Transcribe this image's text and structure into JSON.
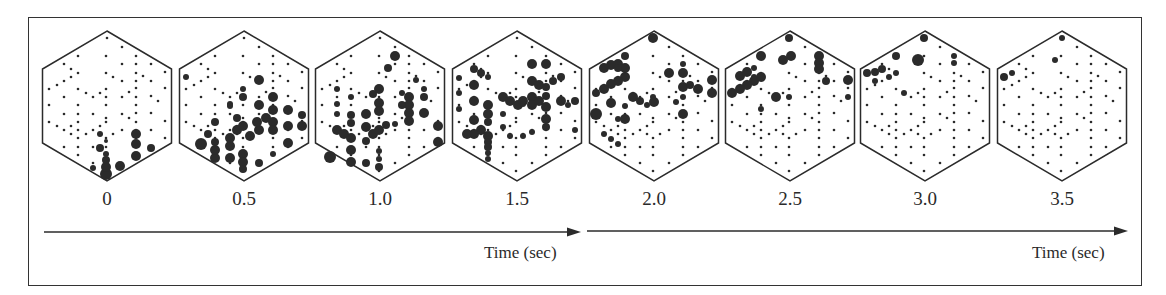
{
  "figure": {
    "frame_labels": [
      "0",
      "0.5",
      "1.0",
      "1.5",
      "2.0",
      "2.5",
      "3.0",
      "3.5"
    ],
    "axis_labels": [
      "Time (sec)",
      "Time (sec)"
    ],
    "colors": {
      "ink": "#2b2b2b",
      "background": "#ffffff"
    },
    "panel_centers_x": [
      107,
      244,
      380,
      517,
      654,
      790,
      925,
      1062
    ],
    "panel_center_y": 106
  },
  "electrode_grid": [
    [
      0,
      -68
    ],
    [
      15,
      -59
    ],
    [
      -29,
      -50
    ],
    [
      -1,
      -50
    ],
    [
      29,
      -50
    ],
    [
      -43,
      -42
    ],
    [
      15,
      -42
    ],
    [
      29,
      -42
    ],
    [
      44,
      -42
    ],
    [
      -36,
      -37
    ],
    [
      -29,
      -33
    ],
    [
      -1,
      -33
    ],
    [
      29,
      -33
    ],
    [
      58,
      -34
    ],
    [
      -36,
      -29
    ],
    [
      -43,
      -25
    ],
    [
      6,
      -29
    ],
    [
      15,
      -25
    ],
    [
      29,
      -25
    ],
    [
      36,
      -30
    ],
    [
      44,
      -25
    ],
    [
      -50,
      -21
    ],
    [
      -58,
      -17
    ],
    [
      -29,
      -17
    ],
    [
      -1,
      -17
    ],
    [
      29,
      -18
    ],
    [
      58,
      -18
    ],
    [
      -21,
      -13
    ],
    [
      -7,
      -13
    ],
    [
      22,
      -14
    ],
    [
      -43,
      -9
    ],
    [
      -14,
      -9
    ],
    [
      -1,
      -9
    ],
    [
      15,
      -9
    ],
    [
      29,
      -9
    ],
    [
      44,
      -10
    ],
    [
      51,
      -5
    ],
    [
      -58,
      -1
    ],
    [
      -29,
      -1
    ],
    [
      -1,
      -1
    ],
    [
      29,
      -1
    ],
    [
      -43,
      8
    ],
    [
      -29,
      8
    ],
    [
      -14,
      8
    ],
    [
      15,
      8
    ],
    [
      29,
      7
    ],
    [
      44,
      7
    ],
    [
      -1,
      12
    ],
    [
      22,
      12
    ],
    [
      -58,
      16
    ],
    [
      -29,
      16
    ],
    [
      -1,
      16
    ],
    [
      29,
      16
    ],
    [
      58,
      15
    ],
    [
      -50,
      20
    ],
    [
      -36,
      20
    ],
    [
      -7,
      20
    ],
    [
      -43,
      24
    ],
    [
      -29,
      24
    ],
    [
      -14,
      24
    ],
    [
      15,
      24
    ],
    [
      29,
      24
    ],
    [
      44,
      24
    ],
    [
      -36,
      28
    ],
    [
      -21,
      28
    ],
    [
      -7,
      28
    ],
    [
      6,
      28
    ],
    [
      -29,
      32
    ],
    [
      -1,
      32
    ],
    [
      29,
      32
    ],
    [
      58,
      32
    ],
    [
      -43,
      41
    ],
    [
      -29,
      41
    ],
    [
      -14,
      41
    ],
    [
      -1,
      41
    ],
    [
      29,
      41
    ],
    [
      44,
      41
    ],
    [
      -29,
      49
    ],
    [
      -1,
      49
    ],
    [
      29,
      49
    ],
    [
      -14,
      57
    ],
    [
      15,
      57
    ],
    [
      -1,
      65
    ]
  ],
  "active_sites": [
    [
      [
        -1,
        68,
        6
      ],
      [
        -1,
        61,
        5
      ],
      [
        -1,
        54,
        4
      ],
      [
        -1,
        48,
        3
      ],
      [
        -14,
        62,
        3
      ],
      [
        -7,
        42,
        4
      ],
      [
        -7,
        28,
        3
      ],
      [
        13,
        60,
        5
      ],
      [
        29,
        50,
        5
      ],
      [
        29,
        38,
        5
      ],
      [
        44,
        42,
        4
      ],
      [
        29,
        28,
        5
      ],
      [
        -1,
        35,
        2
      ]
    ],
    [
      [
        -58,
        -29,
        3
      ],
      [
        -43,
        38,
        6
      ],
      [
        -29,
        52,
        5
      ],
      [
        -29,
        44,
        5
      ],
      [
        -29,
        36,
        4
      ],
      [
        -36,
        28,
        4
      ],
      [
        -14,
        52,
        5
      ],
      [
        -14,
        40,
        5
      ],
      [
        -1,
        48,
        5
      ],
      [
        -1,
        56,
        5
      ],
      [
        -1,
        63,
        4
      ],
      [
        15,
        57,
        4
      ],
      [
        -14,
        32,
        5
      ],
      [
        -7,
        24,
        5
      ],
      [
        -1,
        20,
        5
      ],
      [
        6,
        30,
        5
      ],
      [
        15,
        24,
        5
      ],
      [
        -7,
        12,
        4
      ],
      [
        13,
        16,
        5
      ],
      [
        22,
        12,
        5
      ],
      [
        29,
        -9,
        5
      ],
      [
        15,
        -1,
        5
      ],
      [
        29,
        4,
        5
      ],
      [
        29,
        16,
        5
      ],
      [
        29,
        24,
        5
      ],
      [
        44,
        4,
        5
      ],
      [
        44,
        20,
        5
      ],
      [
        44,
        37,
        5
      ],
      [
        58,
        20,
        5
      ],
      [
        58,
        9,
        4
      ],
      [
        -14,
        -2,
        3
      ],
      [
        -1,
        -9,
        4
      ],
      [
        -1,
        -17,
        3
      ],
      [
        -14,
        0,
        3
      ],
      [
        29,
        48,
        3
      ],
      [
        15,
        -26,
        5
      ],
      [
        -29,
        16,
        4
      ]
    ],
    [
      [
        -50,
        51,
        6
      ],
      [
        -43,
        24,
        5
      ],
      [
        -36,
        28,
        5
      ],
      [
        -29,
        32,
        5
      ],
      [
        -29,
        44,
        5
      ],
      [
        -29,
        56,
        5
      ],
      [
        -29,
        17,
        4
      ],
      [
        -29,
        9,
        4
      ],
      [
        -14,
        35,
        4
      ],
      [
        -14,
        21,
        5
      ],
      [
        -7,
        28,
        5
      ],
      [
        -1,
        24,
        5
      ],
      [
        6,
        19,
        4
      ],
      [
        -14,
        8,
        5
      ],
      [
        -1,
        -17,
        5
      ],
      [
        -7,
        -12,
        4
      ],
      [
        -1,
        -3,
        5
      ],
      [
        -1,
        5,
        5
      ],
      [
        15,
        -50,
        5
      ],
      [
        8,
        -38,
        4
      ],
      [
        29,
        -9,
        5
      ],
      [
        29,
        -1,
        5
      ],
      [
        29,
        7,
        5
      ],
      [
        29,
        15,
        5
      ],
      [
        22,
        -1,
        4
      ],
      [
        44,
        -9,
        4
      ],
      [
        44,
        7,
        5
      ],
      [
        58,
        20,
        5
      ],
      [
        58,
        36,
        5
      ],
      [
        -14,
        57,
        4
      ],
      [
        -1,
        61,
        4
      ],
      [
        -1,
        53,
        3
      ],
      [
        -1,
        45,
        3
      ],
      [
        -29,
        -9,
        3
      ],
      [
        -43,
        -2,
        3
      ],
      [
        -43,
        8,
        3
      ],
      [
        -43,
        -17,
        3
      ],
      [
        22,
        -13,
        3
      ],
      [
        36,
        -26,
        3
      ],
      [
        44,
        -17,
        3
      ],
      [
        15,
        18,
        3
      ]
    ],
    [
      [
        -43,
        -37,
        4
      ],
      [
        -36,
        -33,
        4
      ],
      [
        -29,
        -29,
        3
      ],
      [
        -43,
        -21,
        5
      ],
      [
        -58,
        -13,
        3
      ],
      [
        -43,
        -5,
        5
      ],
      [
        -58,
        3,
        3
      ],
      [
        -43,
        14,
        5
      ],
      [
        -29,
        -1,
        5
      ],
      [
        -29,
        8,
        5
      ],
      [
        -29,
        16,
        4
      ],
      [
        -36,
        24,
        5
      ],
      [
        -43,
        28,
        5
      ],
      [
        -50,
        28,
        5
      ],
      [
        -29,
        30,
        5
      ],
      [
        -29,
        36,
        4
      ],
      [
        -14,
        -9,
        5
      ],
      [
        -7,
        -5,
        5
      ],
      [
        1,
        -1,
        5
      ],
      [
        6,
        -5,
        5
      ],
      [
        15,
        -9,
        5
      ],
      [
        15,
        -1,
        5
      ],
      [
        6,
        -2,
        3
      ],
      [
        15,
        -25,
        5
      ],
      [
        22,
        -21,
        5
      ],
      [
        29,
        -19,
        4
      ],
      [
        36,
        -25,
        4
      ],
      [
        44,
        -29,
        4
      ],
      [
        29,
        -10,
        4
      ],
      [
        22,
        -5,
        5
      ],
      [
        29,
        1,
        5
      ],
      [
        29,
        13,
        5
      ],
      [
        29,
        21,
        4
      ],
      [
        44,
        -5,
        5
      ],
      [
        51,
        -1,
        3
      ],
      [
        58,
        -5,
        4
      ],
      [
        15,
        -42,
        5
      ],
      [
        29,
        -42,
        5
      ],
      [
        -29,
        47,
        3
      ],
      [
        -29,
        41,
        4
      ],
      [
        -29,
        53,
        3
      ],
      [
        -14,
        21,
        3
      ],
      [
        -7,
        30,
        3
      ],
      [
        6,
        30,
        3
      ],
      [
        15,
        26,
        3
      ],
      [
        -14,
        8,
        3
      ],
      [
        58,
        24,
        3
      ],
      [
        -58,
        -28,
        3
      ]
    ],
    [
      [
        -1,
        -68,
        5
      ],
      [
        -29,
        -50,
        4
      ],
      [
        -50,
        -38,
        5
      ],
      [
        -43,
        -41,
        5
      ],
      [
        -36,
        -42,
        5
      ],
      [
        -29,
        -38,
        5
      ],
      [
        -29,
        -29,
        5
      ],
      [
        -36,
        -25,
        5
      ],
      [
        -43,
        -22,
        5
      ],
      [
        -50,
        -17,
        5
      ],
      [
        -58,
        -13,
        4
      ],
      [
        -36,
        -38,
        4
      ],
      [
        -43,
        -3,
        5
      ],
      [
        -58,
        8,
        6
      ],
      [
        -36,
        13,
        3
      ],
      [
        -29,
        13,
        5
      ],
      [
        -29,
        0,
        3
      ],
      [
        -50,
        28,
        3
      ],
      [
        -43,
        33,
        3
      ],
      [
        -36,
        38,
        3
      ],
      [
        -21,
        -9,
        5
      ],
      [
        -14,
        -5,
        4
      ],
      [
        -7,
        -1,
        3
      ],
      [
        -1,
        -9,
        3
      ],
      [
        0,
        -4,
        5
      ],
      [
        15,
        -33,
        5
      ],
      [
        29,
        -33,
        5
      ],
      [
        29,
        -42,
        3
      ],
      [
        29,
        -19,
        5
      ],
      [
        36,
        -21,
        4
      ],
      [
        44,
        -17,
        5
      ],
      [
        58,
        -26,
        5
      ],
      [
        58,
        -13,
        5
      ],
      [
        29,
        -9,
        3
      ],
      [
        29,
        8,
        5
      ],
      [
        22,
        -4,
        3
      ]
    ],
    [
      [
        -1,
        -68,
        4
      ],
      [
        -29,
        -50,
        5
      ],
      [
        -7,
        -46,
        5
      ],
      [
        1,
        -50,
        5
      ],
      [
        29,
        -50,
        5
      ],
      [
        29,
        -43,
        5
      ],
      [
        29,
        -37,
        5
      ],
      [
        36,
        -25,
        4
      ],
      [
        58,
        -26,
        5
      ],
      [
        58,
        -9,
        3
      ],
      [
        -50,
        -30,
        5
      ],
      [
        -43,
        -34,
        5
      ],
      [
        -36,
        -38,
        3
      ],
      [
        -29,
        -29,
        5
      ],
      [
        -36,
        -25,
        5
      ],
      [
        -43,
        -21,
        5
      ],
      [
        -50,
        -17,
        5
      ],
      [
        -58,
        -13,
        5
      ],
      [
        -36,
        -29,
        3
      ],
      [
        -14,
        -9,
        5
      ],
      [
        -1,
        -9,
        3
      ],
      [
        -29,
        3,
        3
      ]
    ],
    [
      [
        -1,
        -68,
        4
      ],
      [
        -29,
        -50,
        4
      ],
      [
        -7,
        -46,
        6
      ],
      [
        29,
        -50,
        3
      ],
      [
        29,
        -43,
        3
      ],
      [
        -58,
        -33,
        4
      ],
      [
        -50,
        -34,
        4
      ],
      [
        -43,
        -37,
        4
      ],
      [
        -29,
        -33,
        3
      ],
      [
        -36,
        -29,
        3
      ],
      [
        -50,
        -25,
        3
      ],
      [
        -21,
        -13,
        3
      ]
    ],
    [
      [
        0,
        -68,
        3
      ],
      [
        -58,
        -29,
        4
      ],
      [
        -50,
        -33,
        3
      ],
      [
        -7,
        -46,
        3
      ]
    ]
  ]
}
